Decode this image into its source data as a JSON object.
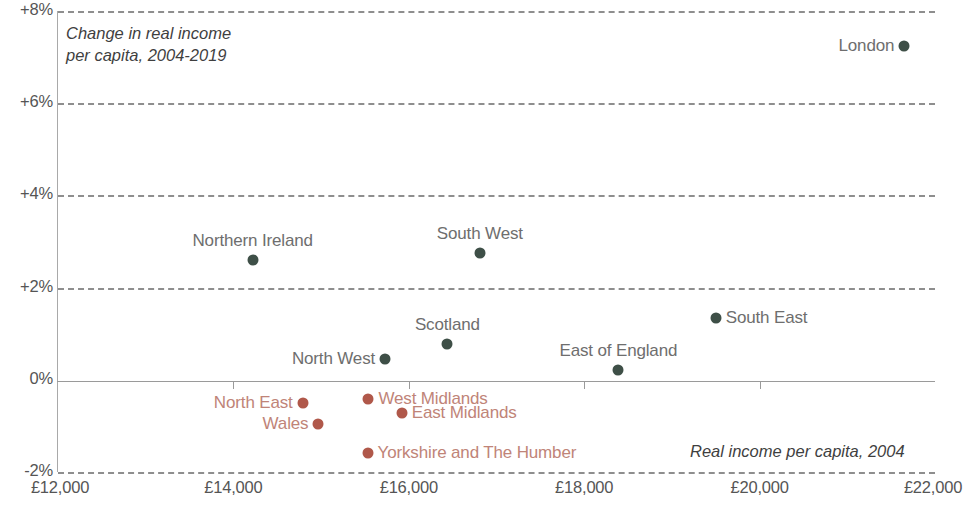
{
  "chart_data": {
    "type": "scatter",
    "title": "",
    "ylabel": "Change in real income per capita, 2004-2019",
    "xlabel": "Real income per capita, 2004",
    "xlim": [
      12000,
      22000
    ],
    "ylim": [
      -2,
      8
    ],
    "grid": true,
    "legend": null,
    "xticks": [
      "£12,000",
      "£14,000",
      "£16,000",
      "£18,000",
      "£20,000",
      "£22,000"
    ],
    "xtick_values": [
      12000,
      14000,
      16000,
      18000,
      20000,
      22000
    ],
    "yticks": [
      "+8%",
      "+6%",
      "+4%",
      "+2%",
      "0%",
      "-2%"
    ],
    "ytick_values": [
      8,
      6,
      4,
      2,
      0,
      -2
    ],
    "colors": {
      "positive": "#3e4f47",
      "negative": "#b0584a",
      "positive_label": "#6e6e6e",
      "negative_label": "#c08478",
      "grid": "#8e8e8e",
      "axis": "#9a9a9a"
    },
    "points": [
      {
        "name": "London",
        "x": 21650,
        "y": 7.25,
        "group": "positive",
        "label_pos": "left"
      },
      {
        "name": "Northern Ireland",
        "x": 14220,
        "y": 2.6,
        "group": "positive",
        "label_pos": "above"
      },
      {
        "name": "South West",
        "x": 16810,
        "y": 2.75,
        "group": "positive",
        "label_pos": "above"
      },
      {
        "name": "South East",
        "x": 19500,
        "y": 1.35,
        "group": "positive",
        "label_pos": "right"
      },
      {
        "name": "Scotland",
        "x": 16440,
        "y": 0.78,
        "group": "positive",
        "label_pos": "above"
      },
      {
        "name": "North West",
        "x": 15730,
        "y": 0.45,
        "group": "positive",
        "label_pos": "left"
      },
      {
        "name": "East of England",
        "x": 18390,
        "y": 0.22,
        "group": "positive",
        "label_pos": "above"
      },
      {
        "name": "West Midlands",
        "x": 15540,
        "y": -0.42,
        "group": "negative",
        "label_pos": "right"
      },
      {
        "name": "North East",
        "x": 14790,
        "y": -0.5,
        "group": "negative",
        "label_pos": "left"
      },
      {
        "name": "East Midlands",
        "x": 15920,
        "y": -0.72,
        "group": "negative",
        "label_pos": "right"
      },
      {
        "name": "Wales",
        "x": 14970,
        "y": -0.95,
        "group": "negative",
        "label_pos": "left"
      },
      {
        "name": "Yorkshire and The Humber",
        "x": 15530,
        "y": -1.58,
        "group": "negative",
        "label_pos": "right"
      }
    ]
  },
  "annotations": {
    "y_axis_title_line1": "Change in real income",
    "y_axis_title_line2": "per capita, 2004-2019",
    "x_axis_title": "Real income per capita, 2004"
  }
}
